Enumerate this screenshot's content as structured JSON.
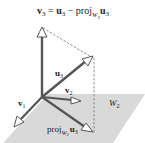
{
  "diagram": {
    "equation": {
      "lhs_vec": "v",
      "lhs_sub": "3",
      "eq": " = ",
      "u_vec": "u",
      "u_sub": "3",
      "minus": " − ",
      "proj": "proj",
      "proj_sub_W": "W",
      "proj_sub_2": "2",
      "proj_u_vec": "u",
      "proj_u_sub": "3"
    },
    "labels": {
      "u3": {
        "vec": "u",
        "sub": "3"
      },
      "v1": {
        "vec": "v",
        "sub": "1"
      },
      "v2": {
        "vec": "v",
        "sub": "2"
      },
      "plane": {
        "name": "W",
        "sub": "2"
      },
      "proj": {
        "proj": "proj",
        "W": "W",
        "sub2": "2",
        "vec": "u",
        "sub": "3"
      }
    },
    "colors": {
      "plane": "#d9d9d9",
      "vector": "#555555",
      "dashed": "#777777",
      "arrowhead_fill": "#ffffff"
    }
  }
}
